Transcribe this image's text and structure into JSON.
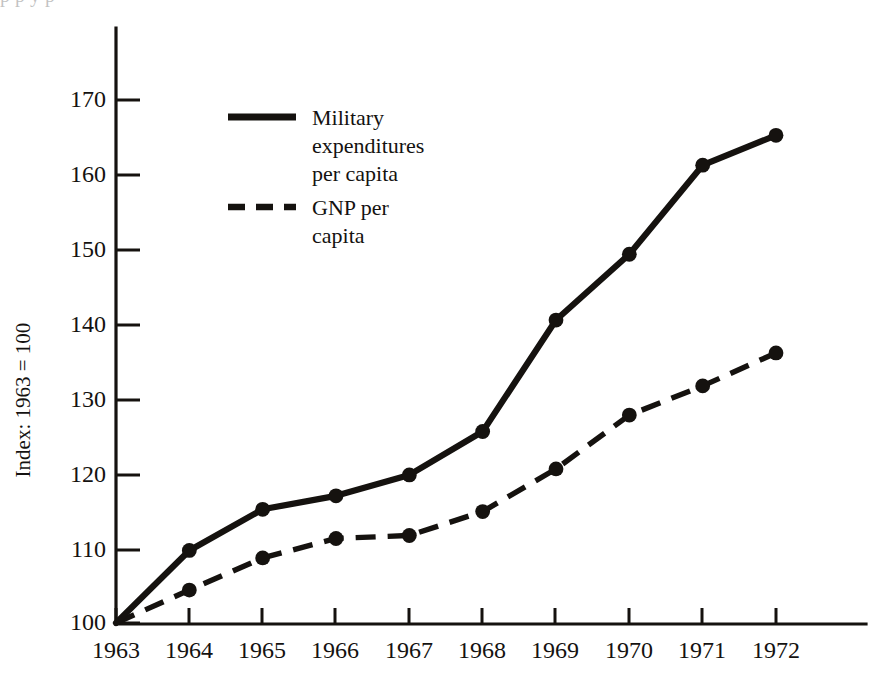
{
  "chart_data": {
    "type": "line",
    "title": "",
    "subtitle": "",
    "xlabel": "",
    "ylabel": "Index: 1963 = 100",
    "categories": [
      "1963",
      "1964",
      "1965",
      "1966",
      "1967",
      "1968",
      "1969",
      "1970",
      "1971",
      "1972"
    ],
    "x": [
      1963,
      1964,
      1965,
      1966,
      1967,
      1968,
      1969,
      1970,
      1971,
      1972
    ],
    "xlim": [
      1963,
      1972.55
    ],
    "ylim": [
      100,
      175
    ],
    "ytick_labels": [
      "100",
      "110",
      "120",
      "130",
      "140",
      "150",
      "160",
      "170"
    ],
    "yticks": [
      100,
      110,
      120,
      130,
      140,
      150,
      160,
      170
    ],
    "grid": false,
    "legend_position": "upper-left-inside",
    "series": [
      {
        "name": "Military expenditures per capita",
        "style": "solid",
        "marker": "filled-circle",
        "color": "#15120f",
        "values": [
          100,
          109.7,
          115.2,
          117.0,
          119.8,
          125.6,
          140.5,
          149.3,
          161.2,
          165.2
        ]
      },
      {
        "name": "GNP per capita",
        "style": "dashed",
        "marker": "filled-circle",
        "color": "#15120f",
        "values": [
          100,
          104.4,
          108.7,
          111.3,
          111.7,
          114.9,
          120.6,
          127.8,
          131.7,
          136.1
        ]
      }
    ],
    "annotations": []
  },
  "legend": {
    "entries": [
      {
        "label_line1": "Military",
        "label_line2": "expenditures",
        "label_line3": "per capita",
        "style": "solid"
      },
      {
        "label_line1": "GNP per",
        "label_line2": "capita",
        "label_line3": "",
        "style": "dashed"
      }
    ]
  },
  "axis": {
    "y_title": "Index: 1963 = 100",
    "y_labels": [
      "170",
      "160",
      "150",
      "140",
      "130",
      "120",
      "110",
      "100"
    ],
    "x_labels": [
      "1963",
      "1964",
      "1965",
      "1966",
      "1967",
      "1968",
      "1969",
      "1970",
      "1971",
      "1972"
    ]
  },
  "page": {
    "top_fragment": "p            p        y                                                                p"
  }
}
